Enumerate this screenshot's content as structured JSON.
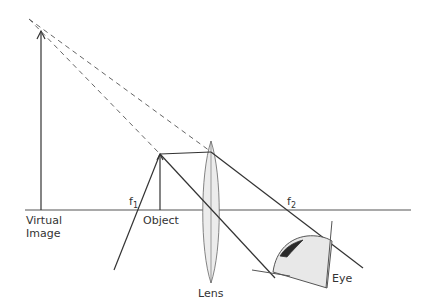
{
  "diagram": {
    "labels": {
      "virtual_image_line1": "Virtual",
      "virtual_image_line2": "Image",
      "object": "Object",
      "lens": "Lens",
      "eye": "Eye",
      "f1": "f",
      "f1_sub": "1",
      "f2": "f",
      "f2_sub": "2"
    },
    "colors": {
      "line": "#333333",
      "lens_fill": "#ececec",
      "eye_fill": "#e8e8e8",
      "pupil": "#2a2a2a"
    }
  }
}
